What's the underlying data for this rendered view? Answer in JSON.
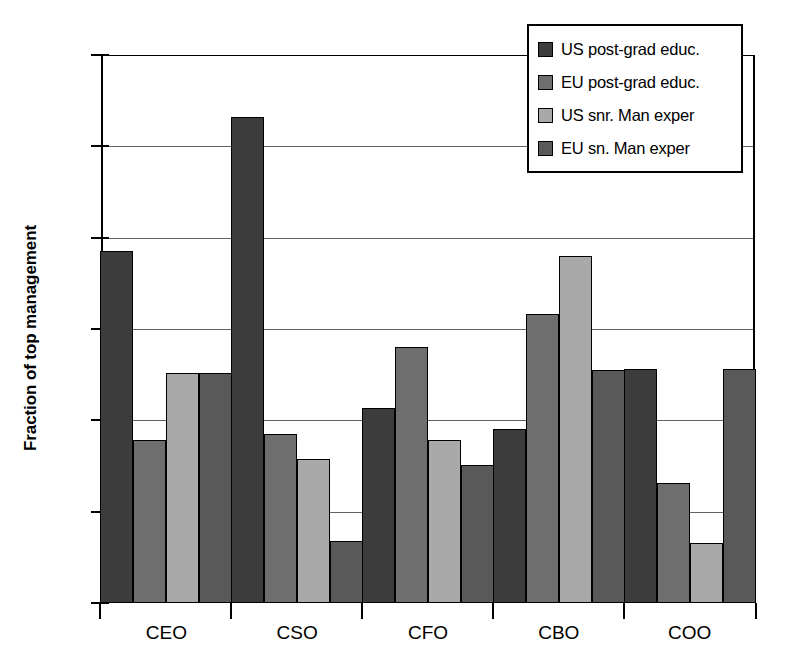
{
  "chart_data": {
    "type": "bar",
    "title": "",
    "xlabel": "",
    "ylabel": "Fraction of top management",
    "ylim": [
      0,
      0.6
    ],
    "ytick_labels": [
      "0",
      "0.1",
      "0.2",
      "0.3",
      "0.4",
      "0.5",
      "0.6"
    ],
    "ytick_values": [
      0,
      0.1,
      0.2,
      0.3,
      0.4,
      0.5,
      0.6
    ],
    "grid": true,
    "legend_position": "top-right",
    "categories": [
      "CEO",
      "CSO",
      "CFO",
      "CBO",
      "COO"
    ],
    "series": [
      {
        "name": "US post-grad educ.",
        "color": "#3c3c3c",
        "values": [
          0.385,
          0.532,
          0.213,
          0.19,
          0.256
        ]
      },
      {
        "name": "EU post-grad educ.",
        "color": "#6e6e6e",
        "values": [
          0.178,
          0.185,
          0.28,
          0.316,
          0.131
        ]
      },
      {
        "name": "US snr. Man exper",
        "color": "#a9a9a9",
        "values": [
          0.252,
          0.158,
          0.178,
          0.38,
          0.066
        ]
      },
      {
        "name": "EU sn. Man exper",
        "color": "#595959",
        "values": [
          0.252,
          0.068,
          0.151,
          0.255,
          0.256
        ]
      }
    ]
  },
  "legend": {
    "items": [
      {
        "label": "US post-grad educ.",
        "color": "#3c3c3c"
      },
      {
        "label": "EU post-grad educ.",
        "color": "#6e6e6e"
      },
      {
        "label": "US snr. Man exper",
        "color": "#a9a9a9"
      },
      {
        "label": "EU sn. Man exper",
        "color": "#595959"
      }
    ]
  }
}
